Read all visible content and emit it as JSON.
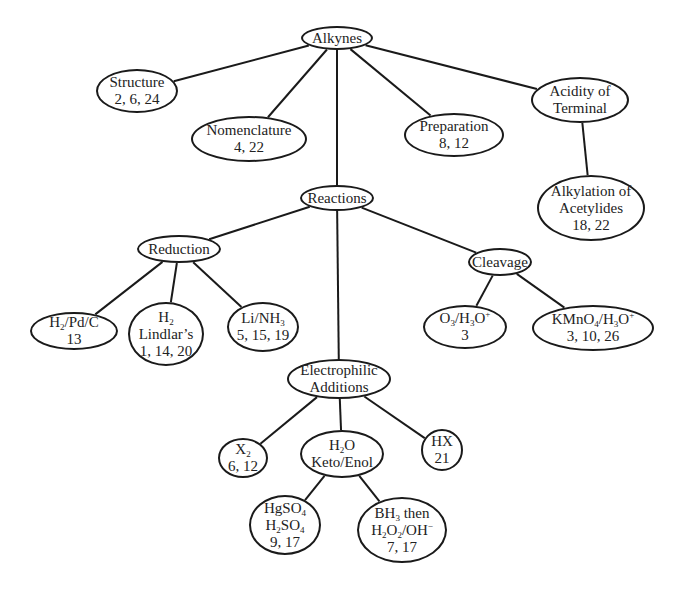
{
  "diagram": {
    "title": "Alkynes",
    "line_color": "#1a1a1a",
    "text_color": "#222222",
    "background": "#ffffff",
    "nodes": [
      {
        "id": "alkynes",
        "lines": [
          "Alkynes"
        ],
        "cx": 337,
        "cy": 38,
        "rx": 36,
        "ry": 12
      },
      {
        "id": "structure",
        "lines": [
          "Structure",
          "2, 6, 24"
        ],
        "cx": 137,
        "cy": 91,
        "rx": 41,
        "ry": 22
      },
      {
        "id": "nomenclature",
        "lines": [
          "Nomenclature",
          "4, 22"
        ],
        "cx": 249,
        "cy": 139,
        "rx": 58,
        "ry": 23
      },
      {
        "id": "preparation",
        "lines": [
          "Preparation",
          "8, 12"
        ],
        "cx": 454,
        "cy": 135,
        "rx": 50,
        "ry": 22
      },
      {
        "id": "acidity",
        "lines": [
          "Acidity of",
          "Terminal"
        ],
        "cx": 580,
        "cy": 100,
        "rx": 49,
        "ry": 23
      },
      {
        "id": "alkylation",
        "lines": [
          "Alkylation of",
          "Acetylides",
          "18, 22"
        ],
        "cx": 591,
        "cy": 208,
        "rx": 54,
        "ry": 33
      },
      {
        "id": "reactions",
        "lines": [
          "Reactions"
        ],
        "cx": 337,
        "cy": 198,
        "rx": 37,
        "ry": 13
      },
      {
        "id": "reduction",
        "lines": [
          "Reduction"
        ],
        "cx": 179,
        "cy": 249,
        "rx": 42,
        "ry": 14
      },
      {
        "id": "cleavage",
        "lines": [
          "Cleavage"
        ],
        "cx": 500,
        "cy": 262,
        "rx": 32,
        "ry": 14
      },
      {
        "id": "h2-pd-c",
        "lines": [
          "H<sub>2</sub>/Pd/C",
          "13"
        ],
        "cx": 74,
        "cy": 331,
        "rx": 44,
        "ry": 19
      },
      {
        "id": "h2-lindlar",
        "lines": [
          "H<sub>2</sub>",
          "Lindlar’s",
          "1, 14, 20"
        ],
        "cx": 166,
        "cy": 334,
        "rx": 38,
        "ry": 32
      },
      {
        "id": "li-nh3",
        "lines": [
          "Li/NH<sub>3</sub>",
          "5, 15, 19"
        ],
        "cx": 263,
        "cy": 327,
        "rx": 36,
        "ry": 25
      },
      {
        "id": "o3-h3o",
        "lines": [
          "O<sub>3</sub>/H<sub>3</sub>O<sup>+</sup>",
          "3"
        ],
        "cx": 465,
        "cy": 327,
        "rx": 42,
        "ry": 22
      },
      {
        "id": "kmno4-h3o",
        "lines": [
          "KMnO<sub>4</sub>/H<sub>3</sub>O<sup>+</sup>",
          "3, 10, 26"
        ],
        "cx": 593,
        "cy": 328,
        "rx": 61,
        "ry": 23
      },
      {
        "id": "electrophilic",
        "lines": [
          "Electrophilic",
          "Additions"
        ],
        "cx": 339,
        "cy": 379,
        "rx": 52,
        "ry": 20
      },
      {
        "id": "x2",
        "lines": [
          "X<sub>2</sub>",
          "6, 12"
        ],
        "cx": 243,
        "cy": 458,
        "rx": 25,
        "ry": 20
      },
      {
        "id": "h2o-keto-enol",
        "lines": [
          "H<sub>2</sub>O",
          "Keto/Enol"
        ],
        "cx": 342,
        "cy": 454,
        "rx": 42,
        "ry": 24
      },
      {
        "id": "hx",
        "lines": [
          "HX",
          "21"
        ],
        "cx": 442,
        "cy": 450,
        "rx": 21,
        "ry": 21
      },
      {
        "id": "hgso4",
        "lines": [
          "HgSO<sub>4</sub>",
          "H<sub>2</sub>SO<sub>4</sub>",
          "9, 17"
        ],
        "cx": 285,
        "cy": 525,
        "rx": 36,
        "ry": 30
      },
      {
        "id": "bh3",
        "lines": [
          "BH<sub>3</sub> then",
          "H<sub>2</sub>O<sub>2</sub>/OH<sup>−</sup>",
          "7, 17"
        ],
        "cx": 402,
        "cy": 530,
        "rx": 45,
        "ry": 33
      }
    ],
    "edges": [
      [
        "alkynes",
        "structure"
      ],
      [
        "alkynes",
        "nomenclature"
      ],
      [
        "alkynes",
        "reactions"
      ],
      [
        "alkynes",
        "preparation"
      ],
      [
        "alkynes",
        "acidity"
      ],
      [
        "acidity",
        "alkylation"
      ],
      [
        "reactions",
        "reduction"
      ],
      [
        "reactions",
        "electrophilic"
      ],
      [
        "reactions",
        "cleavage"
      ],
      [
        "reduction",
        "h2-pd-c"
      ],
      [
        "reduction",
        "h2-lindlar"
      ],
      [
        "reduction",
        "li-nh3"
      ],
      [
        "cleavage",
        "o3-h3o"
      ],
      [
        "cleavage",
        "kmno4-h3o"
      ],
      [
        "electrophilic",
        "x2"
      ],
      [
        "electrophilic",
        "h2o-keto-enol"
      ],
      [
        "electrophilic",
        "hx"
      ],
      [
        "h2o-keto-enol",
        "hgso4"
      ],
      [
        "h2o-keto-enol",
        "bh3"
      ]
    ]
  }
}
